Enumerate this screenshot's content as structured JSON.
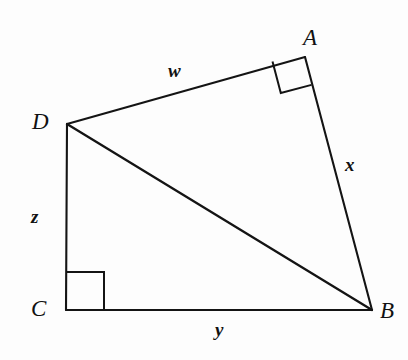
{
  "figure": {
    "background_color": "#fdfdfd",
    "stroke_color": "#141414",
    "vertices": [
      {
        "name": "A",
        "label": "A",
        "x": 305,
        "y": 57
      },
      {
        "name": "B",
        "label": "B",
        "x": 372,
        "y": 310
      },
      {
        "name": "C",
        "label": "C",
        "x": 66,
        "y": 310
      },
      {
        "name": "D",
        "label": "D",
        "x": 67,
        "y": 124
      }
    ],
    "edges": [
      {
        "name": "DA",
        "from": "D",
        "to": "A",
        "label": "w"
      },
      {
        "name": "AB",
        "from": "A",
        "to": "B",
        "label": "x"
      },
      {
        "name": "DC",
        "from": "D",
        "to": "C",
        "label": "z"
      },
      {
        "name": "CB",
        "from": "C",
        "to": "B",
        "label": "y"
      },
      {
        "name": "DB",
        "from": "D",
        "to": "B",
        "label": ""
      }
    ],
    "side_labels": {
      "w": "w",
      "x": "x",
      "y": "y",
      "z": "z"
    },
    "vertex_labels": {
      "A": "A",
      "B": "B",
      "C": "C",
      "D": "D"
    },
    "right_angles": [
      {
        "at": "A",
        "between": [
          "DA",
          "AB"
        ]
      },
      {
        "at": "C",
        "between": [
          "DC",
          "CB"
        ]
      }
    ]
  }
}
